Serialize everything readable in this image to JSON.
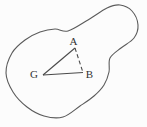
{
  "figure": {
    "background": "#fcfcfc",
    "outline_color": "#5b5b5b",
    "segment_color": "#4a4a4a",
    "label_color": "#333333",
    "blob_points": [
      [
        55,
        29
      ],
      [
        68,
        31
      ],
      [
        88,
        20
      ],
      [
        107,
        8
      ],
      [
        120,
        5
      ],
      [
        132,
        11
      ],
      [
        138,
        25
      ],
      [
        134,
        38
      ],
      [
        121,
        48
      ],
      [
        110,
        58
      ],
      [
        109,
        72
      ],
      [
        104,
        85
      ],
      [
        94,
        96
      ],
      [
        80,
        106
      ],
      [
        63,
        117
      ],
      [
        44,
        116
      ],
      [
        27,
        107
      ],
      [
        13,
        92
      ],
      [
        6,
        73
      ],
      [
        12,
        53
      ],
      [
        25,
        40
      ],
      [
        40,
        32
      ]
    ],
    "vertices": {
      "G": [
        43,
        75
      ],
      "A": [
        75,
        48
      ],
      "B": [
        83,
        72.5
      ]
    },
    "edges": [
      {
        "from": "G",
        "to": "A",
        "style": "solid"
      },
      {
        "from": "G",
        "to": "B",
        "style": "solid"
      },
      {
        "from": "A",
        "to": "B",
        "style": "dashed"
      }
    ],
    "labels": {
      "A": {
        "text": "A",
        "x": 73.5,
        "y": 44.5
      },
      "B": {
        "text": "B",
        "x": 89.5,
        "y": 78
      },
      "G": {
        "text": "G",
        "x": 34,
        "y": 78
      }
    }
  }
}
